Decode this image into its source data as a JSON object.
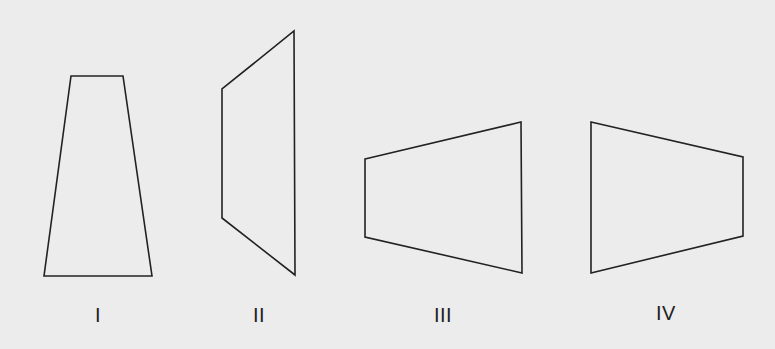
{
  "diagram": {
    "title": "",
    "colors": {
      "background": "#ececec",
      "stroke": "#222222"
    },
    "shapes": [
      {
        "id": "I",
        "label": "I",
        "type": "trapezoid",
        "points": "71,76 123,76 152,276 44,276",
        "label_pos": {
          "x": 98,
          "y": 305
        }
      },
      {
        "id": "II",
        "label": "II",
        "type": "trapezoid",
        "points": "294,31 295,275 222,218 222,89",
        "label_pos": {
          "x": 259,
          "y": 305
        }
      },
      {
        "id": "III",
        "label": "III",
        "type": "trapezoid",
        "points": "365,159 521,122 522,273 365,237",
        "label_pos": {
          "x": 443,
          "y": 305
        }
      },
      {
        "id": "IV",
        "label": "IV",
        "type": "trapezoid",
        "points": "591,122 743,157 743,236 591,273",
        "label_pos": {
          "x": 666,
          "y": 303
        }
      }
    ]
  }
}
